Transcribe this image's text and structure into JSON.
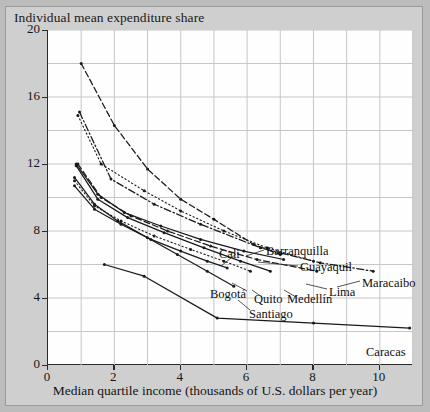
{
  "figure": {
    "y_axis_title": "Individual mean expenditure share",
    "x_axis_title": "Median quartile income (thousands of U.S. dollars per year)"
  },
  "axes": {
    "y_ticks": [
      "0",
      "4",
      "8",
      "12",
      "16",
      "20"
    ],
    "x_ticks": [
      "0",
      "2",
      "4",
      "6",
      "8",
      "10"
    ]
  },
  "labels": {
    "cali": "Cali",
    "barranquilla": "Barranquilla",
    "guayaquil": "Guayaquil",
    "maracaibo": "Maracaibo",
    "bogota": "Bogotá",
    "quito": "Quito",
    "medellin": "Medellín",
    "lima": "Lima",
    "santiago": "Santiago",
    "caracas": "Caracas"
  },
  "chart_data": {
    "type": "line",
    "title": "",
    "xlabel": "Median quartile income (thousands of U.S. dollars per year)",
    "ylabel": "Individual mean expenditure share",
    "xlim": [
      0,
      11
    ],
    "ylim": [
      0,
      20
    ],
    "xticks": [
      0,
      2,
      4,
      6,
      8,
      10
    ],
    "yticks": [
      0,
      4,
      8,
      12,
      16,
      20
    ],
    "grid": true,
    "grid_x_step": 1,
    "grid_y_step": 2,
    "legend": "inline-endpoint-labels",
    "series": [
      {
        "name": "Barranquilla",
        "style": "dashed",
        "color": "#1a1a1a",
        "points": [
          [
            1.0,
            18.0
          ],
          [
            2.0,
            14.3
          ],
          [
            3.0,
            11.7
          ],
          [
            4.0,
            9.9
          ],
          [
            5.0,
            8.7
          ],
          [
            6.2,
            7.2
          ],
          [
            7.0,
            6.6
          ]
        ]
      },
      {
        "name": "Guayaquil",
        "style": "dotted",
        "color": "#1a1a1a",
        "points": [
          [
            0.9,
            14.9
          ],
          [
            1.6,
            12.0
          ],
          [
            2.9,
            10.4
          ],
          [
            4.0,
            9.2
          ],
          [
            5.3,
            8.0
          ],
          [
            6.6,
            7.0
          ],
          [
            8.0,
            6.2
          ]
        ]
      },
      {
        "name": "Maracaibo",
        "style": "dashdot",
        "color": "#1a1a1a",
        "points": [
          [
            0.95,
            15.1
          ],
          [
            1.9,
            11.1
          ],
          [
            3.2,
            9.6
          ],
          [
            4.6,
            8.4
          ],
          [
            6.4,
            7.0
          ],
          [
            8.2,
            6.1
          ],
          [
            9.8,
            5.6
          ]
        ]
      },
      {
        "name": "Cali",
        "style": "solid",
        "color": "#1a1a1a",
        "points": [
          [
            0.85,
            12.0
          ],
          [
            1.5,
            10.2
          ],
          [
            2.3,
            9.1
          ],
          [
            3.4,
            8.3
          ],
          [
            4.6,
            7.5
          ],
          [
            5.9,
            6.8
          ],
          [
            7.1,
            6.3
          ]
        ]
      },
      {
        "name": "Lima",
        "style": "dashed",
        "color": "#1a1a1a",
        "points": [
          [
            0.9,
            12.0
          ],
          [
            1.6,
            10.0
          ],
          [
            2.5,
            8.9
          ],
          [
            3.6,
            8.0
          ],
          [
            4.9,
            7.1
          ],
          [
            6.3,
            6.3
          ],
          [
            8.1,
            5.6
          ]
        ]
      },
      {
        "name": "Medellín",
        "style": "solid",
        "color": "#1a1a1a",
        "points": [
          [
            0.85,
            11.9
          ],
          [
            1.5,
            9.9
          ],
          [
            2.4,
            8.8
          ],
          [
            3.5,
            7.9
          ],
          [
            4.7,
            7.0
          ],
          [
            5.8,
            6.2
          ],
          [
            6.7,
            5.6
          ]
        ]
      },
      {
        "name": "Quito",
        "style": "dotted",
        "color": "#1a1a1a",
        "points": [
          [
            0.8,
            11.0
          ],
          [
            1.4,
            9.5
          ],
          [
            2.2,
            8.6
          ],
          [
            3.2,
            7.7
          ],
          [
            4.3,
            6.9
          ],
          [
            5.3,
            6.2
          ],
          [
            6.1,
            5.6
          ]
        ]
      },
      {
        "name": "Bogotá",
        "style": "solid",
        "color": "#1a1a1a",
        "points": [
          [
            0.8,
            10.7
          ],
          [
            1.4,
            9.3
          ],
          [
            2.2,
            8.4
          ],
          [
            3.1,
            7.5
          ],
          [
            4.0,
            6.8
          ],
          [
            4.8,
            6.2
          ],
          [
            5.4,
            5.8
          ]
        ]
      },
      {
        "name": "Santiago",
        "style": "solid",
        "color": "#1a1a1a",
        "points": [
          [
            0.8,
            11.2
          ],
          [
            1.4,
            9.6
          ],
          [
            2.1,
            8.6
          ],
          [
            3.0,
            7.6
          ],
          [
            3.9,
            6.6
          ],
          [
            4.8,
            5.6
          ],
          [
            5.6,
            4.7
          ]
        ]
      },
      {
        "name": "Caracas",
        "style": "solid",
        "color": "#1a1a1a",
        "points": [
          [
            1.7,
            6.0
          ],
          [
            2.9,
            5.3
          ],
          [
            5.1,
            2.8
          ],
          [
            8.0,
            2.5
          ],
          [
            10.9,
            2.2
          ]
        ]
      }
    ]
  }
}
